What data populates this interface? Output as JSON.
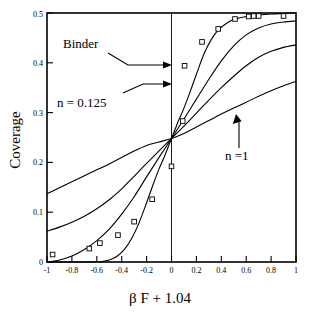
{
  "chart_data": {
    "type": "line",
    "title": "",
    "xlabel": "β F + 1.04",
    "ylabel": "Coverage",
    "xlim": [
      -1,
      1
    ],
    "ylim": [
      0,
      0.5
    ],
    "grid": false,
    "legend_position": "none",
    "xticks": [
      -1,
      -0.8,
      -0.6,
      -0.4,
      -0.2,
      0,
      0.2,
      0.4,
      0.6,
      0.8,
      1
    ],
    "xtick_labels": [
      "-1",
      "-0.8",
      "-0.6",
      "-0.4",
      "-0.2",
      "0",
      "0.2",
      "0.4",
      "0.6",
      "0.8",
      "1"
    ],
    "yticks": [
      0,
      0.1,
      0.2,
      0.3,
      0.4,
      0.5
    ],
    "ytick_labels": [
      "0",
      "0.1",
      "0.2",
      "0.3",
      "0.4",
      "0.5"
    ],
    "crossing_point": {
      "x": 0,
      "y": 0.248
    },
    "vertical_reference_line": {
      "x": 0
    },
    "series": [
      {
        "name": "n = 0.125",
        "style": "solid",
        "steepness_rank": 1,
        "x": [
          -1.0,
          -0.9,
          -0.8,
          -0.7,
          -0.62,
          -0.56,
          -0.5,
          -0.44,
          -0.38,
          -0.32,
          -0.26,
          -0.2,
          -0.15,
          -0.1,
          -0.06,
          -0.03,
          0.0,
          0.03,
          0.06,
          0.1,
          0.15,
          0.2,
          0.26,
          0.32,
          0.38,
          0.44,
          0.5,
          0.6,
          0.7,
          0.8,
          0.9,
          1.0
        ],
        "y": [
          0.0,
          0.0,
          0.0,
          0.0,
          0.0,
          0.001,
          0.004,
          0.011,
          0.025,
          0.047,
          0.079,
          0.119,
          0.154,
          0.187,
          0.21,
          0.229,
          0.248,
          0.267,
          0.286,
          0.309,
          0.342,
          0.377,
          0.417,
          0.447,
          0.467,
          0.479,
          0.487,
          0.493,
          0.496,
          0.498,
          0.499,
          0.5
        ]
      },
      {
        "name": "intermediate-a",
        "style": "solid",
        "steepness_rank": 2,
        "x": [
          -1.0,
          -0.9,
          -0.8,
          -0.7,
          -0.6,
          -0.5,
          -0.4,
          -0.3,
          -0.2,
          -0.1,
          0.0,
          0.1,
          0.2,
          0.3,
          0.4,
          0.5,
          0.6,
          0.7,
          0.8,
          0.9,
          1.0
        ],
        "y": [
          0.0,
          0.004,
          0.012,
          0.025,
          0.043,
          0.066,
          0.096,
          0.131,
          0.171,
          0.21,
          0.248,
          0.287,
          0.327,
          0.367,
          0.404,
          0.434,
          0.456,
          0.47,
          0.478,
          0.482,
          0.484
        ]
      },
      {
        "name": "intermediate-b",
        "style": "solid",
        "steepness_rank": 3,
        "x": [
          -1.0,
          -0.9,
          -0.8,
          -0.7,
          -0.6,
          -0.5,
          -0.4,
          -0.3,
          -0.2,
          -0.1,
          0.0,
          0.1,
          0.2,
          0.3,
          0.4,
          0.5,
          0.6,
          0.7,
          0.8,
          0.9,
          1.0
        ],
        "y": [
          0.062,
          0.07,
          0.08,
          0.092,
          0.107,
          0.125,
          0.147,
          0.172,
          0.198,
          0.223,
          0.248,
          0.273,
          0.299,
          0.325,
          0.35,
          0.373,
          0.394,
          0.411,
          0.423,
          0.431,
          0.436
        ]
      },
      {
        "name": "n =1",
        "style": "solid",
        "steepness_rank": 4,
        "x": [
          -1.0,
          -0.9,
          -0.8,
          -0.7,
          -0.6,
          -0.5,
          -0.4,
          -0.3,
          -0.2,
          -0.1,
          0.0,
          0.1,
          0.2,
          0.3,
          0.4,
          0.5,
          0.6,
          0.7,
          0.8,
          0.9,
          1.0
        ],
        "y": [
          0.137,
          0.149,
          0.161,
          0.173,
          0.185,
          0.197,
          0.21,
          0.223,
          0.234,
          0.241,
          0.248,
          0.258,
          0.271,
          0.284,
          0.297,
          0.309,
          0.321,
          0.333,
          0.344,
          0.354,
          0.363
        ]
      }
    ],
    "points": {
      "name": "Binder",
      "marker": "open-square",
      "x": [
        -0.955,
        -0.66,
        -0.575,
        -0.43,
        -0.3,
        -0.155,
        0.0,
        0.09,
        0.105,
        0.245,
        0.375,
        0.51,
        0.62,
        0.66,
        0.7,
        0.9
      ],
      "y": [
        0.015,
        0.027,
        0.038,
        0.054,
        0.081,
        0.126,
        0.192,
        0.283,
        0.394,
        0.442,
        0.468,
        0.488,
        0.493,
        0.494,
        0.494,
        0.494
      ]
    },
    "annotations": [
      {
        "label": "Binder",
        "text_x": -0.43,
        "text_y": 0.432,
        "target_x": 0.06,
        "target_y": 0.394
      },
      {
        "label": "n = 0.125",
        "text_x": -0.52,
        "text_y": 0.318,
        "target_x": 0.06,
        "target_y": 0.355
      },
      {
        "label": "n =1",
        "text_x": 0.46,
        "text_y": 0.232,
        "target_x": 0.36,
        "target_y": 0.294
      }
    ]
  },
  "labels": {
    "xaxis_title": "β F + 1.04",
    "yaxis_title": "Coverage",
    "binder": "Binder",
    "n_small": "n = 0.125",
    "n_one": "n =1"
  },
  "colors": {
    "axis": "#000000",
    "curve": "#000000",
    "marker_fill": "#ffffff",
    "background": "#ffffff"
  }
}
